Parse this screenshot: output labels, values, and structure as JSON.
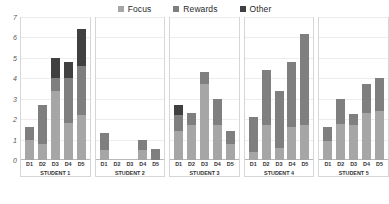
{
  "legend": {
    "items": [
      {
        "label": "Focus",
        "color": "#a6a6a6"
      },
      {
        "label": "Rewards",
        "color": "#7f7f7f"
      },
      {
        "label": "Other",
        "color": "#404040"
      }
    ]
  },
  "axis": {
    "yticks": [
      "7",
      "6",
      "5",
      "4",
      "3",
      "2",
      "1",
      "0"
    ]
  },
  "chart_data": {
    "type": "bar",
    "subtype": "stacked-bar-small-multiples",
    "title": "",
    "xlabel": "",
    "ylabel": "",
    "ylim": [
      0,
      7
    ],
    "ystep": 1,
    "grid": true,
    "legend_position": "top-center",
    "categories": [
      "D1",
      "D2",
      "D3",
      "D4",
      "D5"
    ],
    "panels": [
      "STUDENT 1",
      "STUDENT 2",
      "STUDENT 3",
      "STUDENT 4",
      "STUDENT 5"
    ],
    "series": [
      {
        "name": "Focus",
        "color": "#a6a6a6"
      },
      {
        "name": "Rewards",
        "color": "#7f7f7f"
      },
      {
        "name": "Other",
        "color": "#404040"
      }
    ],
    "values": {
      "STUDENT 1": {
        "Focus": [
          1.0,
          0.8,
          3.4,
          1.8,
          2.2
        ],
        "Rewards": [
          0.6,
          1.9,
          0.6,
          2.2,
          2.4
        ],
        "Other": [
          0.0,
          0.0,
          1.0,
          0.8,
          1.8
        ]
      },
      "STUDENT 2": {
        "Focus": [
          0.5,
          0.0,
          0.0,
          0.5,
          0.0
        ],
        "Rewards": [
          0.8,
          0.0,
          0.0,
          0.5,
          0.55
        ],
        "Other": [
          0.0,
          0.0,
          0.0,
          0.0,
          0.0
        ]
      },
      "STUDENT 3": {
        "Focus": [
          1.4,
          1.7,
          3.7,
          1.7,
          0.8
        ],
        "Rewards": [
          0.8,
          0.6,
          0.6,
          1.3,
          0.6
        ],
        "Other": [
          0.5,
          0.0,
          0.0,
          0.0,
          0.0
        ]
      },
      "STUDENT 4": {
        "Focus": [
          0.4,
          1.7,
          0.6,
          1.6,
          1.7
        ],
        "Rewards": [
          1.7,
          2.7,
          2.8,
          3.2,
          4.45
        ],
        "Other": [
          0.0,
          0.0,
          0.0,
          0.0,
          0.0
        ]
      },
      "STUDENT 5": {
        "Focus": [
          0.95,
          1.75,
          1.7,
          2.3,
          2.4
        ],
        "Rewards": [
          0.65,
          1.25,
          0.55,
          1.4,
          1.6
        ],
        "Other": [
          0.0,
          0.0,
          0.0,
          0.0,
          0.0
        ]
      }
    },
    "totals": {
      "STUDENT 1": [
        1.6,
        2.7,
        5.0,
        4.8,
        6.4
      ],
      "STUDENT 2": [
        1.3,
        0.0,
        0.0,
        1.0,
        0.55
      ],
      "STUDENT 3": [
        2.7,
        2.3,
        4.3,
        3.0,
        1.4
      ],
      "STUDENT 4": [
        2.1,
        4.4,
        3.4,
        4.8,
        6.15
      ],
      "STUDENT 5": [
        1.6,
        3.0,
        2.25,
        3.7,
        4.0
      ]
    }
  }
}
